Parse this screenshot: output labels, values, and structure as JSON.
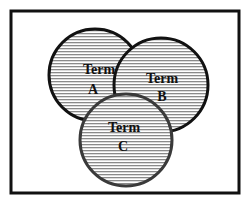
{
  "diagram": {
    "type": "venn",
    "frame": {
      "x": 11,
      "y": 11,
      "width": 228,
      "height": 182,
      "stroke": "#111111",
      "stroke_width": 3
    },
    "hatch": {
      "line_color": "#8a8a8a",
      "background": "#ffffff",
      "spacing": 3
    },
    "circles": [
      {
        "id": "A",
        "term": "Term",
        "letter": "A",
        "cx": 95,
        "cy": 75,
        "r": 46,
        "stroke": "#111111",
        "stroke_width": 3,
        "term_pos": [
          99,
          74
        ],
        "letter_pos": [
          93,
          94
        ]
      },
      {
        "id": "B",
        "term": "Term",
        "letter": "B",
        "cx": 161,
        "cy": 85,
        "r": 47,
        "stroke": "#111111",
        "stroke_width": 3,
        "term_pos": [
          162,
          83
        ],
        "letter_pos": [
          162,
          101
        ]
      },
      {
        "id": "C",
        "term": "Term",
        "letter": "C",
        "cx": 126,
        "cy": 140,
        "r": 46,
        "stroke": "#3a3a3a",
        "stroke_width": 3,
        "term_pos": [
          124,
          132
        ],
        "letter_pos": [
          123,
          151
        ]
      }
    ]
  }
}
